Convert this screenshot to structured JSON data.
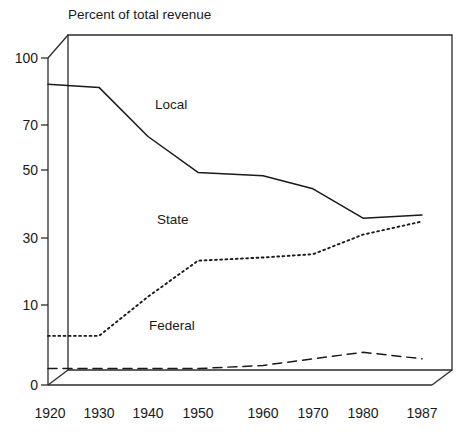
{
  "chart_data": {
    "type": "line",
    "title": "Percent of total revenue",
    "xlabel": "",
    "ylabel": "",
    "x": [
      1920,
      1930,
      1940,
      1950,
      1960,
      1970,
      1980,
      1987
    ],
    "categories": [
      "1920",
      "1930",
      "1940",
      "1950",
      "1960",
      "1970",
      "1980",
      "1987"
    ],
    "xlim": [
      1920,
      1987
    ],
    "ylim": [
      0,
      100
    ],
    "ytick_values": [
      0,
      10,
      30,
      50,
      70,
      100
    ],
    "ytick_labels": [
      "0",
      "10",
      "30",
      "50",
      "70",
      "100"
    ],
    "grid": false,
    "legend_position": "inline-annotations",
    "series": [
      {
        "name": "Local",
        "style": "solid",
        "label_text": "Local",
        "values": [
          92,
          91,
          76,
          65,
          64,
          60,
          51,
          52
        ]
      },
      {
        "name": "State",
        "style": "dotted",
        "label_text": "State",
        "values": [
          15,
          15,
          27,
          38,
          39,
          40,
          46,
          50
        ]
      },
      {
        "name": "Federal",
        "style": "dashed",
        "label_text": "Federal",
        "values": [
          5,
          5,
          5,
          5,
          6,
          8,
          10,
          8
        ]
      }
    ],
    "annotations": [
      {
        "text": "Local",
        "x": 1946,
        "y": 82
      },
      {
        "text": "State",
        "x": 1946,
        "y": 46
      },
      {
        "text": "Federal",
        "x": 1943,
        "y": 14
      }
    ],
    "colors": {
      "axis": "#2b2b2b",
      "text": "#1a1a1a",
      "series": "#1a1a1a",
      "background": "#ffffff"
    }
  },
  "yticks": [
    {
      "label": "100",
      "value": 100
    },
    {
      "label": "70",
      "value": 70
    },
    {
      "label": "50",
      "value": 50
    },
    {
      "label": "30",
      "value": 30
    },
    {
      "label": "10",
      "value": 10
    },
    {
      "label": "0",
      "value": 0
    }
  ],
  "xticks": [
    {
      "label": "1920"
    },
    {
      "label": "1930"
    },
    {
      "label": "1940"
    },
    {
      "label": "1950"
    },
    {
      "label": "1960"
    },
    {
      "label": "1970"
    },
    {
      "label": "1980"
    },
    {
      "label": "1987"
    }
  ]
}
